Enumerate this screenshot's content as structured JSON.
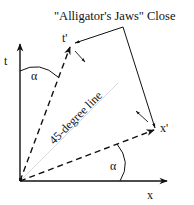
{
  "diagram": {
    "title": "\"Alligator's Jaws\"  Close",
    "labels": {
      "t_axis": "t",
      "x_axis": "x",
      "t_prime": "t'",
      "x_prime": "x'",
      "alpha_top": "α",
      "alpha_bottom": "α",
      "diagonal": "45-degree line"
    },
    "colors": {
      "ink": "#111111",
      "diagonal_line": "#d8d8d8"
    }
  }
}
